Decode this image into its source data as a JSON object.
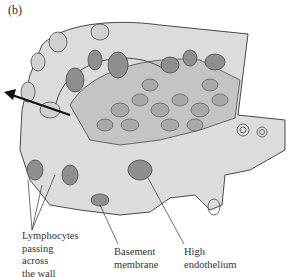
{
  "figure": {
    "panel_label": "(b)"
  },
  "labels": {
    "lymphocytes": [
      "Lymphocytes",
      "passing",
      "across",
      "the wall"
    ],
    "basement_membrane": [
      "Basement",
      "membrane"
    ],
    "high_endothelium": [
      "High",
      "endothelium"
    ]
  },
  "colors": {
    "tissue_light": "#d9d9d9",
    "tissue_mid": "#bdbdbd",
    "nucleus": "#8f8f8f",
    "outline": "#4a4a4a",
    "arrow": "#111111"
  }
}
